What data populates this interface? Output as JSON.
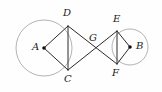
{
  "figure": {
    "type": "geometry-diagram",
    "canvas": {
      "width": 162,
      "height": 92,
      "background": "#fefefe"
    },
    "style": {
      "circle_stroke": "#a9a9a9",
      "line_stroke": "#2b2b2b",
      "label_color": "#1a1a1a",
      "dot_color": "#111111",
      "circle_stroke_width": 0.9,
      "line_stroke_width": 1.0
    },
    "points": [
      {
        "id": "A",
        "label": "A",
        "x": 44,
        "y": 48,
        "dot": true,
        "label_x": 32,
        "label_y": 42
      },
      {
        "id": "B",
        "label": "B",
        "x": 130,
        "y": 47,
        "dot": true,
        "label_x": 136,
        "label_y": 41
      },
      {
        "id": "C",
        "label": "C",
        "x": 68,
        "y": 70,
        "dot": false,
        "label_x": 64,
        "label_y": 74
      },
      {
        "id": "D",
        "label": "D",
        "x": 68,
        "y": 26,
        "dot": false,
        "label_x": 63,
        "label_y": 8
      },
      {
        "id": "E",
        "label": "E",
        "x": 117,
        "y": 31,
        "dot": false,
        "label_x": 113,
        "label_y": 14
      },
      {
        "id": "F",
        "label": "F",
        "x": 117,
        "y": 64,
        "dot": false,
        "label_x": 112,
        "label_y": 68
      },
      {
        "id": "G",
        "label": "G",
        "x": 95,
        "y": 48,
        "dot": false,
        "label_x": 89,
        "label_y": 33
      }
    ],
    "circles": [
      {
        "id": "circle-A",
        "center": "A",
        "cx": 44,
        "cy": 48,
        "r": 28
      },
      {
        "id": "circle-B",
        "center": "B",
        "cx": 130,
        "cy": 47,
        "r": 18
      }
    ],
    "segments": [
      {
        "id": "AD",
        "from": "A",
        "to": "D",
        "x1": 44,
        "y1": 48,
        "x2": 68,
        "y2": 26
      },
      {
        "id": "AC",
        "from": "A",
        "to": "C",
        "x1": 44,
        "y1": 48,
        "x2": 68,
        "y2": 70
      },
      {
        "id": "DC",
        "from": "D",
        "to": "C",
        "x1": 68,
        "y1": 26,
        "x2": 68,
        "y2": 70
      },
      {
        "id": "DF",
        "from": "D",
        "to": "F",
        "x1": 68,
        "y1": 26,
        "x2": 117,
        "y2": 64
      },
      {
        "id": "CE",
        "from": "C",
        "to": "E",
        "x1": 68,
        "y1": 70,
        "x2": 117,
        "y2": 31
      },
      {
        "id": "EF",
        "from": "E",
        "to": "F",
        "x1": 117,
        "y1": 31,
        "x2": 117,
        "y2": 64
      },
      {
        "id": "EB",
        "from": "E",
        "to": "B",
        "x1": 117,
        "y1": 31,
        "x2": 130,
        "y2": 47
      },
      {
        "id": "FB",
        "from": "F",
        "to": "B",
        "x1": 117,
        "y1": 64,
        "x2": 130,
        "y2": 47
      }
    ]
  }
}
